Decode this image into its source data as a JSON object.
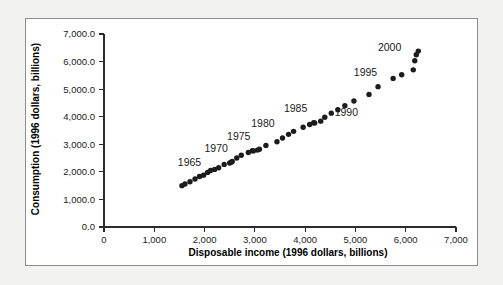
{
  "chart_data": {
    "type": "scatter",
    "title": "",
    "xlabel": "Disposable income (1996 dollars, billions)",
    "ylabel": "Consumption (1996 dollars, billions)",
    "xlim": [
      0,
      7000
    ],
    "ylim": [
      0,
      7000
    ],
    "grid": false,
    "legend": "none",
    "x_ticks": [
      0,
      1000,
      2000,
      3000,
      4000,
      5000,
      6000,
      7000
    ],
    "x_tick_labels": [
      "0",
      "1,000",
      "2,000",
      "3,000",
      "4,000",
      "5,000",
      "6,000",
      "7,000"
    ],
    "y_ticks": [
      0,
      1000,
      2000,
      3000,
      4000,
      5000,
      6000,
      7000
    ],
    "y_tick_labels": [
      "0.0",
      "1,000.0",
      "2,000.0",
      "3,000.0",
      "4,000.0",
      "5,000.0",
      "6,000.0",
      "7,000.0"
    ],
    "marker": "filled-circle",
    "marker_color": "#1c1c1c",
    "points": [
      {
        "year": 1962,
        "x": 1550,
        "y": 1500
      },
      {
        "year": 1963,
        "x": 1610,
        "y": 1560
      },
      {
        "year": 1964,
        "x": 1710,
        "y": 1640
      },
      {
        "year": 1965,
        "x": 1810,
        "y": 1740
      },
      {
        "year": 1966,
        "x": 1900,
        "y": 1830
      },
      {
        "year": 1967,
        "x": 1980,
        "y": 1880
      },
      {
        "year": 1968,
        "x": 2060,
        "y": 1980
      },
      {
        "year": 1969,
        "x": 2120,
        "y": 2050
      },
      {
        "year": 1970,
        "x": 2200,
        "y": 2090
      },
      {
        "year": 1971,
        "x": 2280,
        "y": 2150
      },
      {
        "year": 1972,
        "x": 2390,
        "y": 2270
      },
      {
        "year": 1973,
        "x": 2530,
        "y": 2350
      },
      {
        "year": 1974,
        "x": 2500,
        "y": 2320
      },
      {
        "year": 1975,
        "x": 2550,
        "y": 2380
      },
      {
        "year": 1976,
        "x": 2640,
        "y": 2500
      },
      {
        "year": 1977,
        "x": 2730,
        "y": 2600
      },
      {
        "year": 1978,
        "x": 2870,
        "y": 2700
      },
      {
        "year": 1979,
        "x": 2950,
        "y": 2770
      },
      {
        "year": 1980,
        "x": 2970,
        "y": 2760
      },
      {
        "year": 1981,
        "x": 3050,
        "y": 2790
      },
      {
        "year": 1982,
        "x": 3090,
        "y": 2820
      },
      {
        "year": 1983,
        "x": 3220,
        "y": 2960
      },
      {
        "year": 1984,
        "x": 3440,
        "y": 3090
      },
      {
        "year": 1985,
        "x": 3550,
        "y": 3230
      },
      {
        "year": 1986,
        "x": 3670,
        "y": 3360
      },
      {
        "year": 1987,
        "x": 3770,
        "y": 3470
      },
      {
        "year": 1988,
        "x": 3960,
        "y": 3620
      },
      {
        "year": 1989,
        "x": 4090,
        "y": 3720
      },
      {
        "year": 1990,
        "x": 4170,
        "y": 3780
      },
      {
        "year": 1991,
        "x": 4190,
        "y": 3770
      },
      {
        "year": 1992,
        "x": 4310,
        "y": 3840
      },
      {
        "year": 1993,
        "x": 4390,
        "y": 3980
      },
      {
        "year": 1994,
        "x": 4520,
        "y": 4130
      },
      {
        "year": 1995,
        "x": 4650,
        "y": 4250
      },
      {
        "year": 1996,
        "x": 4790,
        "y": 4400
      },
      {
        "year": 1997,
        "x": 4970,
        "y": 4570
      },
      {
        "year": 1998,
        "x": 5270,
        "y": 4810
      },
      {
        "year": 1999,
        "x": 5450,
        "y": 5090
      },
      {
        "year": 2000,
        "x": 5750,
        "y": 5390
      },
      {
        "year": 2001,
        "x": 5920,
        "y": 5520
      },
      {
        "year": 2002,
        "x": 6150,
        "y": 5700
      },
      {
        "year": 2003,
        "x": 6180,
        "y": 6030
      },
      {
        "year": 2004,
        "x": 6210,
        "y": 6250
      },
      {
        "year": 2005,
        "x": 6250,
        "y": 6380
      }
    ],
    "annotations": [
      {
        "label": "1965",
        "x": 1700,
        "y": 2200
      },
      {
        "label": "1970",
        "x": 2230,
        "y": 2720
      },
      {
        "label": "1975",
        "x": 2680,
        "y": 3160
      },
      {
        "label": "1980",
        "x": 3160,
        "y": 3620
      },
      {
        "label": "1985",
        "x": 3810,
        "y": 4160
      },
      {
        "label": "1990",
        "x": 4820,
        "y": 4040
      },
      {
        "label": "1995",
        "x": 5200,
        "y": 5480
      },
      {
        "label": "2000",
        "x": 5680,
        "y": 6390
      }
    ]
  },
  "axis_titles": {
    "x": "Disposable income (1996 dollars, billions)",
    "y": "Consumption (1996 dollars, billions)"
  }
}
